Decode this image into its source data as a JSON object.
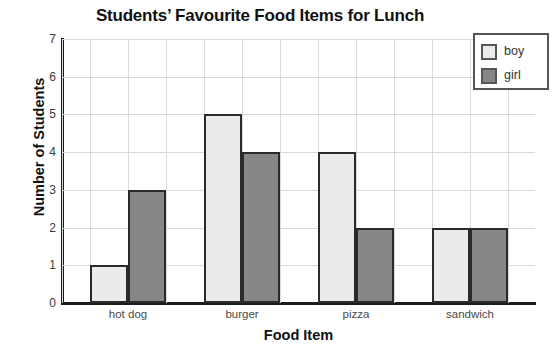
{
  "chart_data": {
    "type": "bar",
    "title": "Students’ Favourite Food Items for Lunch",
    "xlabel": "Food Item",
    "ylabel": "Number of Students",
    "categories": [
      "hot dog",
      "burger",
      "pizza",
      "sandwich"
    ],
    "series": [
      {
        "name": "boy",
        "color": "#ebebeb",
        "values": [
          1,
          5,
          4,
          2
        ]
      },
      {
        "name": "girl",
        "color": "#878787",
        "values": [
          3,
          4,
          2,
          2
        ]
      }
    ],
    "ylim": [
      0,
      7
    ],
    "yticks": [
      0,
      1,
      2,
      3,
      4,
      5,
      6,
      7
    ],
    "ytick_labels": [
      "0",
      "1",
      "2",
      "3",
      "4",
      "5",
      "6",
      "7"
    ],
    "grid": true,
    "grid_color": "#d9d9d9",
    "legend_position": "top-right",
    "axis_color": "#1c1c1c",
    "bar_edge_color": "#2b2b2b",
    "background": "#ffffff"
  }
}
